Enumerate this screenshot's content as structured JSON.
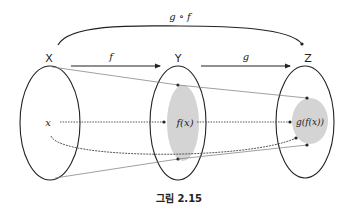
{
  "diagram": {
    "sets": [
      {
        "id": "X",
        "label": "X"
      },
      {
        "id": "Y",
        "label": "Y"
      },
      {
        "id": "Z",
        "label": "Z"
      }
    ],
    "maps": {
      "f": "f",
      "g": "g",
      "composite": "g ∘ f"
    },
    "elements": {
      "x": "x",
      "fx": "f(x)",
      "gfx": "g(f(x))"
    },
    "colors": {
      "stroke": "#222222",
      "shade": "#d4d4d4",
      "thin_line": "#777777"
    }
  },
  "caption": "그림 2.15"
}
